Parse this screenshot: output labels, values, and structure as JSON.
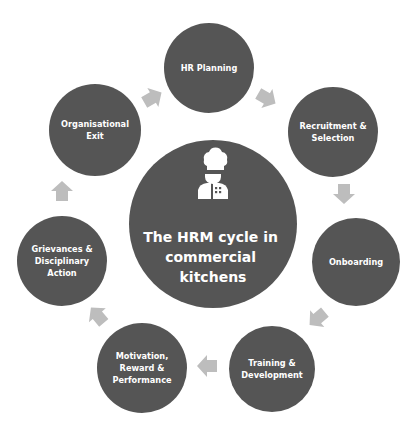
{
  "diagram": {
    "title": "The HRM cycle in commercial kitchens",
    "center": {
      "label_lines": [
        "The HRM cycle in",
        "commercial",
        "kitchens"
      ],
      "icon": "chef-icon"
    },
    "stages": [
      {
        "id": "hr-planning",
        "label_lines": [
          "HR Planning"
        ]
      },
      {
        "id": "recruitment-selection",
        "label_lines": [
          "Recruitment &",
          "Selection"
        ]
      },
      {
        "id": "onboarding",
        "label_lines": [
          "Onboarding"
        ]
      },
      {
        "id": "training-development",
        "label_lines": [
          "Training &",
          "Development"
        ]
      },
      {
        "id": "motivation-reward-performance",
        "label_lines": [
          "Motivation,",
          "Reward &",
          "Performance"
        ]
      },
      {
        "id": "grievances-disciplinary-action",
        "label_lines": [
          "Grievances &",
          "Disciplinary",
          "Action"
        ]
      },
      {
        "id": "organisational-exit",
        "label_lines": [
          "Organisational",
          "Exit"
        ]
      }
    ],
    "flow": "clockwise",
    "colors": {
      "node_fill": "#555555",
      "arrow_fill": "#bdbdbd",
      "text": "#ffffff",
      "background": "#ffffff"
    }
  }
}
